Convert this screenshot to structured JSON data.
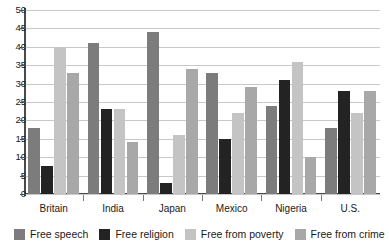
{
  "chart_data": {
    "type": "bar",
    "title": "",
    "subtitle": "",
    "xlabel": "",
    "ylabel": "",
    "ylim": [
      0,
      50
    ],
    "ytick_labels": [
      "50",
      "45",
      "40",
      "35",
      "30",
      "25",
      "20",
      "15",
      "10",
      "5",
      "0"
    ],
    "ytick_values": [
      50,
      45,
      40,
      35,
      30,
      25,
      20,
      15,
      10,
      5,
      0
    ],
    "grid": true,
    "legend_position": "bottom",
    "categories": [
      "Britain",
      "India",
      "Japan",
      "Mexico",
      "Nigeria",
      "U.S."
    ],
    "series": [
      {
        "name": "Free speech",
        "color": "#7c7c7c",
        "values": [
          18,
          41,
          44,
          33,
          24,
          18
        ]
      },
      {
        "name": "Free religion",
        "color": "#232323",
        "values": [
          7.5,
          23,
          3,
          15,
          31,
          28
        ]
      },
      {
        "name": "Free from poverty",
        "color": "#c4c4c4",
        "values": [
          40,
          23,
          16,
          22,
          36,
          22
        ]
      },
      {
        "name": "Free from crime",
        "color": "#a8a8a8",
        "values": [
          33,
          14,
          34,
          29,
          10,
          28
        ]
      }
    ]
  },
  "legend": {
    "items": [
      {
        "label": "Free speech",
        "swatch": "s0"
      },
      {
        "label": "Free religion",
        "swatch": "s1"
      },
      {
        "label": "Free from poverty",
        "swatch": "s2"
      },
      {
        "label": "Free from crime",
        "swatch": "s3"
      }
    ]
  }
}
